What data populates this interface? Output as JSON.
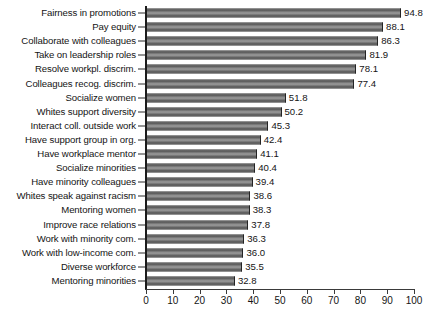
{
  "chart_data": {
    "type": "bar",
    "orientation": "horizontal",
    "title": "",
    "subtitle": "",
    "xlabel": "",
    "ylabel": "",
    "xlim": [
      0,
      100
    ],
    "xticks": [
      0,
      10,
      20,
      30,
      40,
      50,
      60,
      70,
      80,
      90,
      100
    ],
    "grid": false,
    "legend": null,
    "bar_color": "#8f8f8f",
    "bar_edge_color": "#242424",
    "categories": [
      "Fairness in  promotions",
      "Pay equity",
      "Collaborate with colleagues",
      "Take on leadership roles",
      "Resolve workpl. discrim.",
      "Colleagues recog. discrim.",
      "Socialize women",
      "Whites support diversity",
      "Interact coll. outside work",
      "Have support group in org.",
      "Have workplace mentor",
      "Socialize minorities",
      "Have minority colleagues",
      "Whites speak against racism",
      "Mentoring women",
      "Improve race relations",
      "Work with minority com.",
      "Work with low-income com.",
      "Diverse workforce",
      "Mentoring minorities"
    ],
    "values": [
      94.8,
      88.1,
      86.3,
      81.9,
      78.1,
      77.4,
      51.8,
      50.2,
      45.3,
      42.4,
      41.1,
      40.4,
      39.4,
      38.6,
      38.3,
      37.8,
      36.3,
      36.0,
      35.5,
      32.8
    ],
    "value_labels": [
      "94.8",
      "88.1",
      "86.3",
      "81.9",
      "78.1",
      "77.4",
      "51.8",
      "50.2",
      "45.3",
      "42.4",
      "41.1",
      "40.4",
      "39.4",
      "38.6",
      "38.3",
      "37.8",
      "36.3",
      "36.0",
      "35.5",
      "32.8"
    ]
  }
}
